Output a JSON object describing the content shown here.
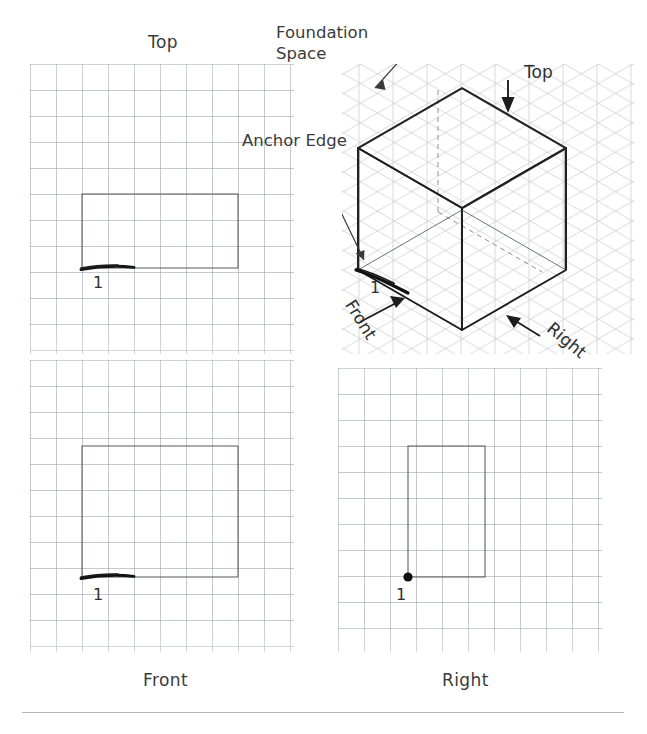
{
  "figure": {
    "type": "isometric-sketching-exercise"
  },
  "views": {
    "top": {
      "caption": "Top",
      "anchor_label": "1",
      "width_units": 4,
      "depth_units": 2
    },
    "front": {
      "caption": "Front",
      "anchor_label": "1",
      "width_units": 4,
      "height_units": 3
    },
    "right": {
      "caption": "Right",
      "anchor_label": "1",
      "depth_units": 2,
      "height_units": 3
    }
  },
  "pictorial": {
    "top_label": "Top",
    "front_label": "Front",
    "right_label": "Right",
    "anchor_label": "1"
  },
  "annotations": {
    "foundation_space_line1": "Foundation",
    "foundation_space_line2": "Space",
    "anchor_edge": "Anchor Edge"
  },
  "colors": {
    "grid": "#969ba5",
    "iso_grid": "#b9bcc4",
    "ink": "#3a3a3a",
    "bold_ink": "#1a1a1a",
    "paper": "#ffffff"
  },
  "footer": {
    "rule": true,
    "caption_partial": ""
  }
}
